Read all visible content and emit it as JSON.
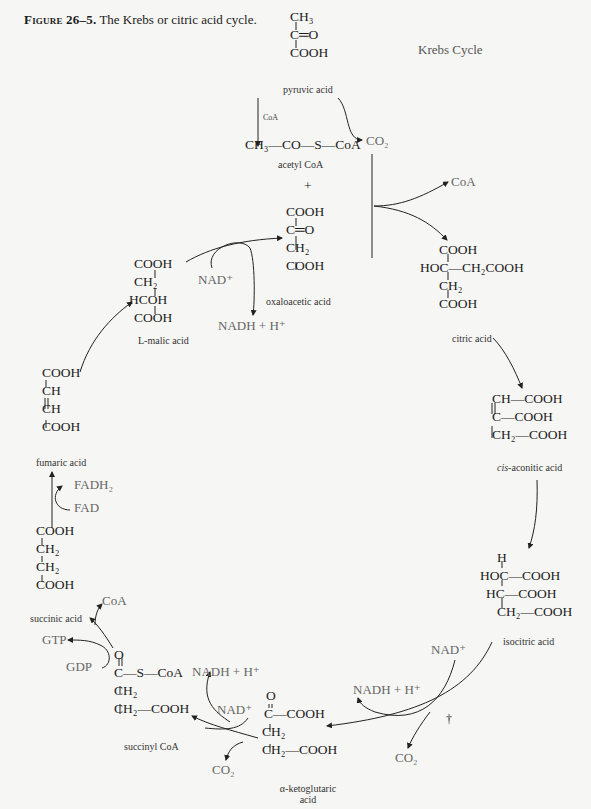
{
  "caption": {
    "figure_label": "Figure 26–5.",
    "text": "The Krebs or citric acid cycle."
  },
  "title": "Krebs Cycle",
  "molecules": {
    "pyruvic_acid": {
      "rows": [
        "CH₃",
        "C═O",
        "COOH"
      ],
      "name": "pyruvic acid"
    },
    "acetyl_coa": {
      "formula": "CH₃—CO—S—CoA",
      "name": "acetyl CoA"
    },
    "plus": "+",
    "oxaloacetic_acid": {
      "rows": [
        "COOH",
        "C═O",
        "CH₂",
        "COOH"
      ],
      "name": "oxaloacetic acid"
    },
    "citric_acid": {
      "rows": [
        "COOH",
        "HOC—CH₂COOH",
        "CH₂",
        "COOH"
      ],
      "name": "citric acid"
    },
    "cis_aconitic_acid": {
      "rows": [
        "CH—COOH",
        "C—COOH",
        "CH₂—COOH"
      ],
      "name_italic": "cis",
      "name": "-aconitic acid"
    },
    "isocitric_acid": {
      "rows": [
        "H",
        "HOC—COOH",
        "HC—COOH",
        "CH₂—COOH"
      ],
      "name": "isocitric acid"
    },
    "alpha_ketoglutaric_acid": {
      "rows": [
        "O",
        "C—COOH",
        "CH₂",
        "CH₂—COOH"
      ],
      "name": "α-ketoglutaric",
      "name2": "acid"
    },
    "succinyl_coa": {
      "rows": [
        "O",
        "C—S—CoA",
        "CH₂",
        "CH₂—COOH"
      ],
      "name": "succinyl CoA"
    },
    "succinic_acid": {
      "rows": [
        "COOH",
        "CH₂",
        "CH₂",
        "COOH"
      ],
      "name": "succinic acid"
    },
    "fumaric_acid": {
      "rows": [
        "COOH",
        "CH",
        "CH",
        "COOH"
      ],
      "name": "fumaric acid"
    },
    "l_malic_acid": {
      "rows": [
        "COOH",
        "CH₂",
        "HCOH",
        "COOH"
      ],
      "name_prefix": "L",
      "name": "-malic acid"
    }
  },
  "cofactors": {
    "coa_small": "CoA",
    "co2_top": "CO₂",
    "coa_out": "CoA",
    "nad_malate": "NAD⁺",
    "nadh_malate": "NADH + H⁺",
    "nad_isocitrate": "NAD⁺",
    "nadh_isocitrate": "NADH + H⁺",
    "co2_isocitrate": "CO₂",
    "dagger": "†",
    "nadh_ketoglutarate": "NADH + H⁺",
    "nad_ketoglutarate": "NAD⁺",
    "co2_ketoglutarate": "CO₂",
    "coa_succinyl": "CoA",
    "gtp": "GTP",
    "gdp": "GDP",
    "fadh2": "FADH₂",
    "fad": "FAD"
  }
}
